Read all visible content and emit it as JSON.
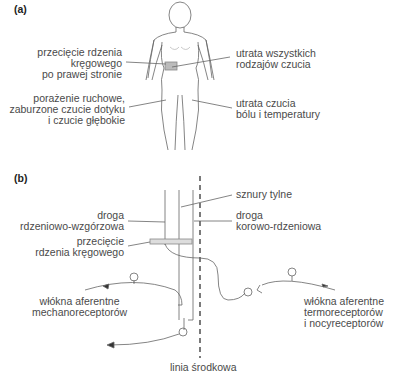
{
  "panel_a": {
    "tag": "(a)",
    "labels": {
      "cut_line1": "przecięcie rdzenia",
      "cut_line2": "kręgowego",
      "cut_line3": "po prawej stronie",
      "motor_line1": "porażenie ruchowe,",
      "motor_line2": "zaburzone czucie dotyku",
      "motor_line3": "i czucie głębokie",
      "all_line1": "utrata wszystkich",
      "all_line2": "rodzajów czucia",
      "pain_line1": "utrata czucia",
      "pain_line2": "bólu i temperatury"
    }
  },
  "panel_b": {
    "tag": "(b)",
    "labels": {
      "posterior": "sznury tylne",
      "spinothalamic_line1": "droga",
      "spinothalamic_line2": "rdzeniowo-wzgórzowa",
      "corticospinal_line1": "droga",
      "corticospinal_line2": "korowo-rdzeniowa",
      "cut_line1": "przecięcie",
      "cut_line2": "rdzenia kręgowego",
      "mechano_line1": "włókna aferentne",
      "mechano_line2": "mechanoreceptorów",
      "thermo_line1": "włókna aferentne",
      "thermo_line2": "termoreceptorów",
      "thermo_line3": "i nocyreceptorów",
      "midline": "linia środkowa"
    }
  },
  "colors": {
    "line": "#555555",
    "text": "#4a4a4a",
    "lesion": "#bbbbbb"
  }
}
